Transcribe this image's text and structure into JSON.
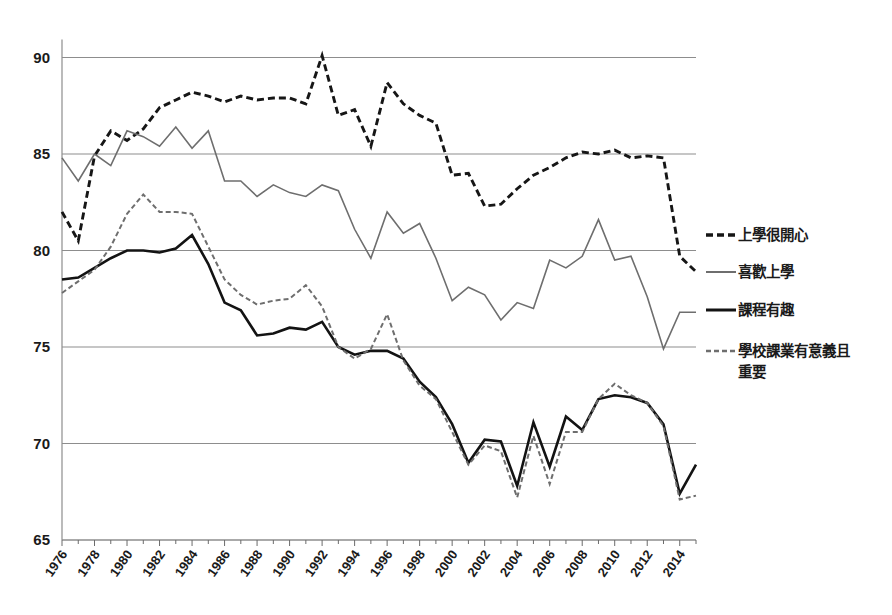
{
  "chart_data": {
    "type": "line",
    "title": "",
    "subtitle": "",
    "xlabel": "",
    "ylabel": "",
    "xlim": [
      1976,
      2015
    ],
    "ylim": [
      65,
      90
    ],
    "grid": true,
    "legend_position": "right",
    "y_ticks": [
      65,
      70,
      75,
      80,
      85,
      90
    ],
    "x_tick_labels": [
      "1976",
      "1978",
      "1980",
      "1982",
      "1984",
      "1986",
      "1988",
      "1990",
      "1992",
      "1994",
      "1996",
      "1998",
      "2000",
      "2002",
      "2004",
      "2006",
      "2008",
      "2010",
      "2012",
      "2014"
    ],
    "x_tick_years": [
      1976,
      1978,
      1980,
      1982,
      1984,
      1986,
      1988,
      1990,
      1992,
      1994,
      1996,
      1998,
      2000,
      2002,
      2004,
      2006,
      2008,
      2010,
      2012,
      2014
    ],
    "x": [
      1976,
      1977,
      1978,
      1979,
      1980,
      1981,
      1982,
      1983,
      1984,
      1985,
      1986,
      1987,
      1988,
      1989,
      1990,
      1991,
      1992,
      1993,
      1994,
      1995,
      1996,
      1997,
      1998,
      1999,
      2000,
      2001,
      2002,
      2003,
      2004,
      2005,
      2006,
      2007,
      2008,
      2009,
      2010,
      2011,
      2012,
      2013,
      2014,
      2015
    ],
    "series": [
      {
        "name": "上學很開心",
        "style": "dashed",
        "color": "#161616",
        "width": 2.9,
        "dash": "7,4",
        "values": [
          82.0,
          80.5,
          84.9,
          86.2,
          85.7,
          86.3,
          87.4,
          87.8,
          88.2,
          88.0,
          87.7,
          88.0,
          87.8,
          87.9,
          87.9,
          87.6,
          90.1,
          87.0,
          87.3,
          85.4,
          88.7,
          87.6,
          87.0,
          86.6,
          83.9,
          84.0,
          82.3,
          82.4,
          83.2,
          83.9,
          84.3,
          84.8,
          85.1,
          85.0,
          85.2,
          84.8,
          84.9,
          84.8,
          79.7,
          78.9
        ]
      },
      {
        "name": "喜歡上學",
        "style": "solid",
        "color": "#6e6e6e",
        "width": 1.6,
        "dash": "",
        "values": [
          84.8,
          83.6,
          85.0,
          84.4,
          86.2,
          85.9,
          85.4,
          86.4,
          85.3,
          86.2,
          83.6,
          83.6,
          82.8,
          83.4,
          83.0,
          82.8,
          83.4,
          83.1,
          81.1,
          79.6,
          82.0,
          80.9,
          81.4,
          79.6,
          77.4,
          78.1,
          77.7,
          76.4,
          77.3,
          77.0,
          79.5,
          79.1,
          79.7,
          81.6,
          79.5,
          79.7,
          77.6,
          74.9,
          76.8,
          76.8
        ]
      },
      {
        "name": "課程有趣",
        "style": "solid",
        "color": "#131313",
        "width": 2.6,
        "dash": "",
        "values": [
          78.5,
          78.6,
          79.1,
          79.6,
          80.0,
          80.0,
          79.9,
          80.1,
          80.8,
          79.3,
          77.3,
          76.9,
          75.6,
          75.7,
          76.0,
          75.9,
          76.3,
          75.0,
          74.6,
          74.8,
          74.8,
          74.4,
          73.2,
          72.4,
          71.0,
          69.0,
          70.2,
          70.1,
          67.8,
          71.1,
          68.8,
          71.4,
          70.7,
          72.3,
          72.5,
          72.4,
          72.1,
          71.0,
          67.4,
          68.9
        ]
      },
      {
        "name": "學校課業有意義且重要",
        "style": "dashed",
        "color": "#6e6e6e",
        "width": 2.0,
        "dash": "5,3",
        "values": [
          77.8,
          78.4,
          79.0,
          80.2,
          81.9,
          82.9,
          82.0,
          82.0,
          81.9,
          80.2,
          78.5,
          77.7,
          77.2,
          77.4,
          77.5,
          78.2,
          77.1,
          75.0,
          74.4,
          74.9,
          76.7,
          74.3,
          73.0,
          72.3,
          70.6,
          68.9,
          69.9,
          69.6,
          67.2,
          70.4,
          67.9,
          70.6,
          70.6,
          72.3,
          73.1,
          72.5,
          72.1,
          70.9,
          67.1,
          67.3
        ]
      }
    ]
  },
  "legend": {
    "items": [
      {
        "label": "上學很開心",
        "swatch": "dashed-black"
      },
      {
        "label": "喜歡上學",
        "swatch": "solid-gray"
      },
      {
        "label": "課程有趣",
        "swatch": "solid-black"
      },
      {
        "label": "學校課業有意義且重要",
        "swatch": "dashed-gray"
      }
    ]
  },
  "colors": {
    "dashed_black": "#161616",
    "solid_gray": "#6e6e6e",
    "solid_black": "#131313",
    "dashed_gray": "#6e6e6e",
    "gridline": "#8d8d8d",
    "background": "#ffffff"
  }
}
